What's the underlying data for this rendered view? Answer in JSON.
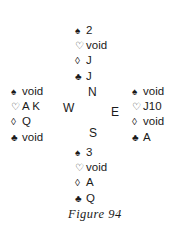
{
  "figure": {
    "caption": "Figure 94",
    "compass": {
      "north": "N",
      "south": "S",
      "west": "W",
      "east": "E"
    },
    "hands": {
      "north": [
        {
          "suit": "spades",
          "symbol": "♠",
          "cards": "2"
        },
        {
          "suit": "hearts",
          "symbol": "♡",
          "cards": "void"
        },
        {
          "suit": "diamonds",
          "symbol": "◊",
          "cards": "J"
        },
        {
          "suit": "clubs",
          "symbol": "♣",
          "cards": "J"
        }
      ],
      "west": [
        {
          "suit": "spades",
          "symbol": "♠",
          "cards": "void"
        },
        {
          "suit": "hearts",
          "symbol": "♡",
          "cards": "A K"
        },
        {
          "suit": "diamonds",
          "symbol": "◊",
          "cards": "Q"
        },
        {
          "suit": "clubs",
          "symbol": "♣",
          "cards": "void"
        }
      ],
      "east": [
        {
          "suit": "spades",
          "symbol": "♠",
          "cards": "void"
        },
        {
          "suit": "hearts",
          "symbol": "♡",
          "cards": "J10"
        },
        {
          "suit": "diamonds",
          "symbol": "◊",
          "cards": "void"
        },
        {
          "suit": "clubs",
          "symbol": "♣",
          "cards": "A"
        }
      ],
      "south": [
        {
          "suit": "spades",
          "symbol": "♠",
          "cards": "3"
        },
        {
          "suit": "hearts",
          "symbol": "♡",
          "cards": "void"
        },
        {
          "suit": "diamonds",
          "symbol": "◊",
          "cards": "A"
        },
        {
          "suit": "clubs",
          "symbol": "♣",
          "cards": "Q"
        }
      ]
    }
  }
}
